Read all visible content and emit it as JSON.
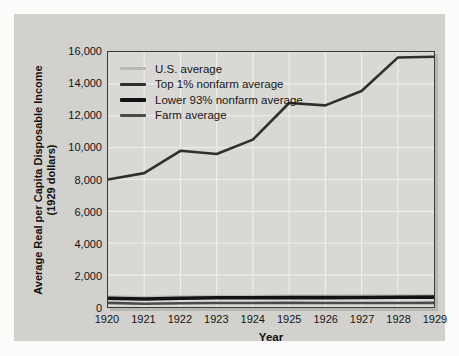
{
  "axes": {
    "y_title_line1": "Average Real per Capita Disposable Income",
    "y_title_line2": "(1929 dollars)",
    "x_title": "Year",
    "y_tick_labels_top_to_bottom": [
      "16,000",
      "14,000",
      "12,000",
      "10,000",
      "8,000",
      "6,000",
      "4,000",
      "2,000",
      "0"
    ],
    "x_tick_labels": [
      "1920",
      "1921",
      "1922",
      "1923",
      "1924",
      "1925",
      "1926",
      "1927",
      "1928",
      "1929"
    ]
  },
  "chart_data": {
    "type": "line",
    "title": "",
    "xlabel": "Year",
    "ylabel": "Average Real per Capita Disposable Income (1929 dollars)",
    "x": [
      1920,
      1921,
      1922,
      1923,
      1924,
      1925,
      1926,
      1927,
      1928,
      1929
    ],
    "ylim": [
      0,
      16000
    ],
    "y_tick_step": 2000,
    "grid": true,
    "legend_position": "top-left-inside",
    "series": [
      {
        "name": "U.S. average",
        "color": "#b9b9b6",
        "stroke_width": 3,
        "values": [
          640,
          590,
          640,
          680,
          680,
          690,
          690,
          700,
          710,
          720
        ]
      },
      {
        "name": "Top 1% nonfarm average",
        "color": "#2f2f2f",
        "stroke_width": 2.6,
        "values": [
          8000,
          8400,
          9800,
          9600,
          10500,
          12800,
          12650,
          13550,
          15650,
          15700
        ]
      },
      {
        "name": "Lower 93% nonfarm average",
        "color": "#121212",
        "stroke_width": 3.6,
        "values": [
          550,
          500,
          550,
          580,
          580,
          590,
          590,
          600,
          610,
          620
        ]
      },
      {
        "name": "Farm average",
        "color": "#4a4a4a",
        "stroke_width": 2.6,
        "values": [
          260,
          200,
          230,
          250,
          250,
          260,
          250,
          250,
          250,
          260
        ]
      }
    ]
  },
  "colors": {
    "page_bg": "#fcfcfa",
    "panel_bg": "#d2d1ce",
    "plot_bg": "#d9d8d5",
    "gridline": "#eeede9",
    "plot_border": "#3a3a3a",
    "text": "#1a1a1a"
  }
}
